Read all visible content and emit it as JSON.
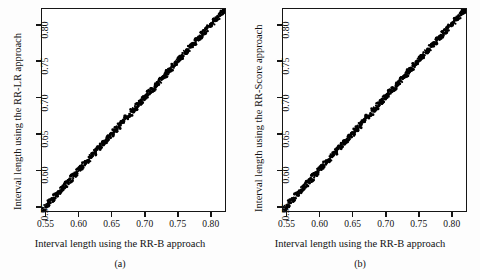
{
  "figure": {
    "background_color": "#fdfdfd",
    "plot_background_color": "#ffffff",
    "axis_color": "#151515",
    "point_color": "#000000"
  },
  "panels": [
    {
      "caption": "(a)",
      "xlabel": "Interval length using the RR-B approach",
      "ylabel": "Interval length using the RR-LR approach",
      "xticks": [
        "0.55",
        "0.60",
        "0.65",
        "0.70",
        "0.75",
        "0.80"
      ],
      "yticks": [
        "0.55",
        "0.60",
        "0.65",
        "0.70",
        "0.75",
        "0.80"
      ]
    },
    {
      "caption": "(b)",
      "xlabel": "Interval length using the RR-B approach",
      "ylabel": "Interval length using the RR-Score approach",
      "xticks": [
        "0.55",
        "0.60",
        "0.65",
        "0.70",
        "0.75",
        "0.80"
      ],
      "yticks": [
        "0.55",
        "0.60",
        "0.65",
        "0.70",
        "0.75",
        "0.80"
      ]
    }
  ],
  "chart_data": [
    {
      "type": "scatter",
      "title": "(a)",
      "xlabel": "Interval length using the RR-B approach",
      "ylabel": "Interval length using the RR-LR approach",
      "xlim": [
        0.543,
        0.823
      ],
      "ylim": [
        0.543,
        0.823
      ],
      "xticks": [
        0.55,
        0.6,
        0.65,
        0.7,
        0.75,
        0.8
      ],
      "yticks": [
        0.55,
        0.6,
        0.65,
        0.7,
        0.75,
        0.8
      ],
      "grid": false,
      "legend": null,
      "series": [
        {
          "name": "RR-LR vs RR-B",
          "marker": "filled-circle",
          "color": "#000000",
          "description": "Dense cloud of points lying essentially on the 45-degree identity line from the lower-left to the upper-right corner of the frame.",
          "x": [
            0.545,
            0.549,
            0.552,
            0.555,
            0.558,
            0.561,
            0.563,
            0.566,
            0.569,
            0.572,
            0.575,
            0.578,
            0.581,
            0.584,
            0.587,
            0.59,
            0.593,
            0.596,
            0.599,
            0.602,
            0.605,
            0.608,
            0.611,
            0.614,
            0.617,
            0.62,
            0.623,
            0.626,
            0.629,
            0.632,
            0.635,
            0.638,
            0.641,
            0.644,
            0.647,
            0.65,
            0.653,
            0.656,
            0.659,
            0.662,
            0.665,
            0.668,
            0.671,
            0.674,
            0.677,
            0.68,
            0.683,
            0.686,
            0.689,
            0.692,
            0.695,
            0.698,
            0.701,
            0.704,
            0.707,
            0.71,
            0.713,
            0.716,
            0.719,
            0.722,
            0.725,
            0.728,
            0.731,
            0.734,
            0.737,
            0.74,
            0.743,
            0.746,
            0.749,
            0.752,
            0.755,
            0.758,
            0.761,
            0.764,
            0.767,
            0.77,
            0.773,
            0.776,
            0.779,
            0.782,
            0.785,
            0.788,
            0.791,
            0.794,
            0.797,
            0.8,
            0.803,
            0.806,
            0.809,
            0.812,
            0.815,
            0.818,
            0.82,
            0.822
          ],
          "y": [
            0.545,
            0.55,
            0.552,
            0.556,
            0.558,
            0.56,
            0.564,
            0.566,
            0.568,
            0.573,
            0.575,
            0.577,
            0.582,
            0.584,
            0.586,
            0.591,
            0.593,
            0.595,
            0.6,
            0.602,
            0.604,
            0.609,
            0.611,
            0.613,
            0.618,
            0.62,
            0.622,
            0.627,
            0.629,
            0.631,
            0.636,
            0.638,
            0.64,
            0.645,
            0.647,
            0.649,
            0.654,
            0.656,
            0.658,
            0.663,
            0.665,
            0.667,
            0.672,
            0.674,
            0.676,
            0.681,
            0.683,
            0.685,
            0.69,
            0.692,
            0.694,
            0.699,
            0.701,
            0.703,
            0.708,
            0.71,
            0.712,
            0.717,
            0.719,
            0.721,
            0.726,
            0.728,
            0.73,
            0.735,
            0.737,
            0.739,
            0.744,
            0.746,
            0.748,
            0.753,
            0.755,
            0.757,
            0.762,
            0.764,
            0.766,
            0.771,
            0.773,
            0.775,
            0.78,
            0.782,
            0.784,
            0.789,
            0.791,
            0.793,
            0.798,
            0.8,
            0.802,
            0.807,
            0.809,
            0.811,
            0.816,
            0.818,
            0.82,
            0.822
          ]
        }
      ],
      "reference_line": {
        "type": "identity",
        "slope": 1,
        "intercept": 0
      }
    },
    {
      "type": "scatter",
      "title": "(b)",
      "xlabel": "Interval length using the RR-B approach",
      "ylabel": "Interval length using the RR-Score approach",
      "xlim": [
        0.543,
        0.823
      ],
      "ylim": [
        0.543,
        0.823
      ],
      "xticks": [
        0.55,
        0.6,
        0.65,
        0.7,
        0.75,
        0.8
      ],
      "yticks": [
        0.55,
        0.6,
        0.65,
        0.7,
        0.75,
        0.8
      ],
      "grid": false,
      "legend": null,
      "series": [
        {
          "name": "RR-Score vs RR-B",
          "marker": "filled-circle",
          "color": "#000000",
          "description": "Dense cloud of points lying essentially on the 45-degree identity line from the lower-left to the upper-right corner of the frame.",
          "x": [
            0.545,
            0.548,
            0.551,
            0.554,
            0.557,
            0.56,
            0.563,
            0.566,
            0.569,
            0.572,
            0.575,
            0.578,
            0.581,
            0.584,
            0.587,
            0.59,
            0.593,
            0.596,
            0.599,
            0.602,
            0.605,
            0.608,
            0.611,
            0.614,
            0.617,
            0.62,
            0.623,
            0.626,
            0.629,
            0.632,
            0.635,
            0.638,
            0.641,
            0.644,
            0.647,
            0.65,
            0.653,
            0.656,
            0.659,
            0.662,
            0.665,
            0.668,
            0.671,
            0.674,
            0.677,
            0.68,
            0.683,
            0.686,
            0.689,
            0.692,
            0.695,
            0.698,
            0.701,
            0.704,
            0.707,
            0.71,
            0.713,
            0.716,
            0.719,
            0.722,
            0.725,
            0.728,
            0.731,
            0.734,
            0.737,
            0.74,
            0.743,
            0.746,
            0.749,
            0.752,
            0.755,
            0.758,
            0.761,
            0.764,
            0.767,
            0.77,
            0.773,
            0.776,
            0.779,
            0.782,
            0.785,
            0.788,
            0.791,
            0.794,
            0.797,
            0.8,
            0.803,
            0.806,
            0.809,
            0.812,
            0.815,
            0.818,
            0.82,
            0.822
          ],
          "y": [
            0.546,
            0.549,
            0.551,
            0.556,
            0.558,
            0.56,
            0.565,
            0.567,
            0.569,
            0.574,
            0.576,
            0.578,
            0.583,
            0.585,
            0.587,
            0.592,
            0.594,
            0.596,
            0.601,
            0.603,
            0.605,
            0.61,
            0.612,
            0.614,
            0.619,
            0.621,
            0.623,
            0.628,
            0.63,
            0.632,
            0.637,
            0.639,
            0.641,
            0.646,
            0.648,
            0.65,
            0.655,
            0.657,
            0.659,
            0.664,
            0.666,
            0.668,
            0.673,
            0.675,
            0.677,
            0.682,
            0.684,
            0.686,
            0.691,
            0.693,
            0.695,
            0.7,
            0.702,
            0.704,
            0.709,
            0.711,
            0.713,
            0.718,
            0.72,
            0.722,
            0.727,
            0.729,
            0.731,
            0.736,
            0.738,
            0.74,
            0.745,
            0.747,
            0.749,
            0.754,
            0.756,
            0.758,
            0.763,
            0.765,
            0.767,
            0.772,
            0.774,
            0.776,
            0.781,
            0.783,
            0.785,
            0.79,
            0.792,
            0.794,
            0.799,
            0.801,
            0.803,
            0.808,
            0.81,
            0.812,
            0.817,
            0.819,
            0.82,
            0.822
          ]
        }
      ],
      "reference_line": {
        "type": "identity",
        "slope": 1,
        "intercept": 0
      }
    }
  ]
}
